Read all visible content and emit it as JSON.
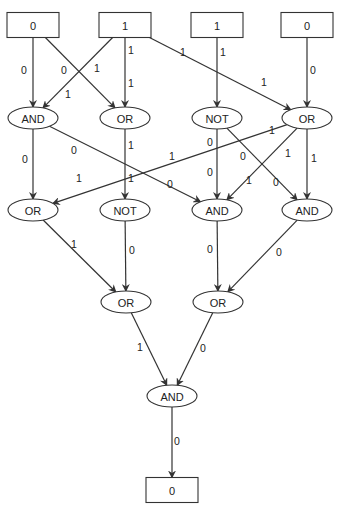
{
  "diagram": {
    "type": "logic-circuit-evaluation",
    "colors": {
      "stroke": "#333333",
      "text": "#222222",
      "background": "#ffffff"
    },
    "nodes": [
      {
        "id": "in0",
        "shape": "box",
        "label": "0",
        "x": 33,
        "y": 25
      },
      {
        "id": "in1",
        "shape": "box",
        "label": "1",
        "x": 125,
        "y": 25
      },
      {
        "id": "in2",
        "shape": "box",
        "label": "1",
        "x": 217,
        "y": 25
      },
      {
        "id": "in3",
        "shape": "box",
        "label": "0",
        "x": 307,
        "y": 25
      },
      {
        "id": "r1a",
        "shape": "ellipse",
        "label": "AND",
        "x": 33,
        "y": 118
      },
      {
        "id": "r1b",
        "shape": "ellipse",
        "label": "OR",
        "x": 125,
        "y": 118
      },
      {
        "id": "r1c",
        "shape": "ellipse",
        "label": "NOT",
        "x": 217,
        "y": 118
      },
      {
        "id": "r1d",
        "shape": "ellipse",
        "label": "OR",
        "x": 307,
        "y": 118
      },
      {
        "id": "r2a",
        "shape": "ellipse",
        "label": "OR",
        "x": 33,
        "y": 210
      },
      {
        "id": "r2b",
        "shape": "ellipse",
        "label": "NOT",
        "x": 125,
        "y": 210
      },
      {
        "id": "r2c",
        "shape": "ellipse",
        "label": "AND",
        "x": 217,
        "y": 210
      },
      {
        "id": "r2d",
        "shape": "ellipse",
        "label": "AND",
        "x": 307,
        "y": 210
      },
      {
        "id": "r3a",
        "shape": "ellipse",
        "label": "OR",
        "x": 126,
        "y": 302
      },
      {
        "id": "r3b",
        "shape": "ellipse",
        "label": "OR",
        "x": 218,
        "y": 302
      },
      {
        "id": "r4",
        "shape": "ellipse",
        "label": "AND",
        "x": 172,
        "y": 396
      },
      {
        "id": "out",
        "shape": "box",
        "label": "0",
        "x": 172,
        "y": 490
      }
    ],
    "edges": [
      {
        "from": "in0",
        "to": "r1a",
        "label": "0",
        "lx": 24,
        "ly": 70
      },
      {
        "from": "in0",
        "to": "r1b",
        "label": "0",
        "lx": 64,
        "ly": 70
      },
      {
        "from": "in1",
        "to": "r1a",
        "label": "1",
        "lx": 68,
        "ly": 94
      },
      {
        "from": "in1",
        "to": "r1a",
        "label": "1",
        "lx": 97,
        "ly": 68,
        "dup_label": true
      },
      {
        "from": "in1",
        "to": "r1b",
        "label": "1",
        "lx": 131,
        "ly": 50
      },
      {
        "from": "in1",
        "to": "r1b",
        "label": "1",
        "lx": 131,
        "ly": 83,
        "dup_label": true
      },
      {
        "from": "in1",
        "to": "r1d",
        "label": "1",
        "lx": 183,
        "ly": 52
      },
      {
        "from": "in1",
        "to": "r1d",
        "label": "1",
        "lx": 264,
        "ly": 82,
        "dup_label": true
      },
      {
        "from": "in2",
        "to": "r1c",
        "label": "1",
        "lx": 223,
        "ly": 52
      },
      {
        "from": "in3",
        "to": "r1d",
        "label": "0",
        "lx": 313,
        "ly": 70
      },
      {
        "from": "r1a",
        "to": "r2a",
        "label": "0",
        "lx": 25,
        "ly": 159
      },
      {
        "from": "r1a",
        "to": "r2c",
        "label": "0",
        "lx": 74,
        "ly": 150
      },
      {
        "from": "r1a",
        "to": "r2c",
        "label": "0",
        "lx": 170,
        "ly": 184,
        "dup_label": true
      },
      {
        "from": "r1b",
        "to": "r2b",
        "label": "1",
        "lx": 131,
        "ly": 145
      },
      {
        "from": "r1b",
        "to": "r2b",
        "label": "1",
        "lx": 131,
        "ly": 178,
        "dup_label": true
      },
      {
        "from": "r1d",
        "to": "r2a",
        "label": "1",
        "lx": 79,
        "ly": 178
      },
      {
        "from": "r1d",
        "to": "r2a",
        "label": "1",
        "lx": 172,
        "ly": 156,
        "dup_label": true
      },
      {
        "from": "r1d",
        "to": "r2a",
        "label": "1",
        "lx": 272,
        "ly": 130,
        "dup_label": true
      },
      {
        "from": "r1c",
        "to": "r2c",
        "label": "0",
        "lx": 210,
        "ly": 142
      },
      {
        "from": "r1c",
        "to": "r2c",
        "label": "0",
        "lx": 210,
        "ly": 172,
        "dup_label": true
      },
      {
        "from": "r1c",
        "to": "r2d",
        "label": "0",
        "lx": 243,
        "ly": 156
      },
      {
        "from": "r1c",
        "to": "r2d",
        "label": "0",
        "lx": 276,
        "ly": 182,
        "dup_label": true
      },
      {
        "from": "r1d",
        "to": "r2c",
        "label": "1",
        "lx": 288,
        "ly": 153
      },
      {
        "from": "r1d",
        "to": "r2c",
        "label": "1",
        "lx": 249,
        "ly": 180,
        "dup_label": true
      },
      {
        "from": "r1d",
        "to": "r2d",
        "label": "1",
        "lx": 314,
        "ly": 158
      },
      {
        "from": "r2a",
        "to": "r3a",
        "label": "1",
        "lx": 74,
        "ly": 244
      },
      {
        "from": "r2b",
        "to": "r3a",
        "label": "0",
        "lx": 132,
        "ly": 250
      },
      {
        "from": "r2c",
        "to": "r3b",
        "label": "0",
        "lx": 210,
        "ly": 249
      },
      {
        "from": "r2d",
        "to": "r3b",
        "label": "0",
        "lx": 279,
        "ly": 252
      },
      {
        "from": "r3a",
        "to": "r4",
        "label": "1",
        "lx": 140,
        "ly": 347
      },
      {
        "from": "r3b",
        "to": "r4",
        "label": "0",
        "lx": 203,
        "ly": 348
      },
      {
        "from": "r4",
        "to": "out",
        "label": "0",
        "lx": 177,
        "ly": 441
      }
    ]
  }
}
